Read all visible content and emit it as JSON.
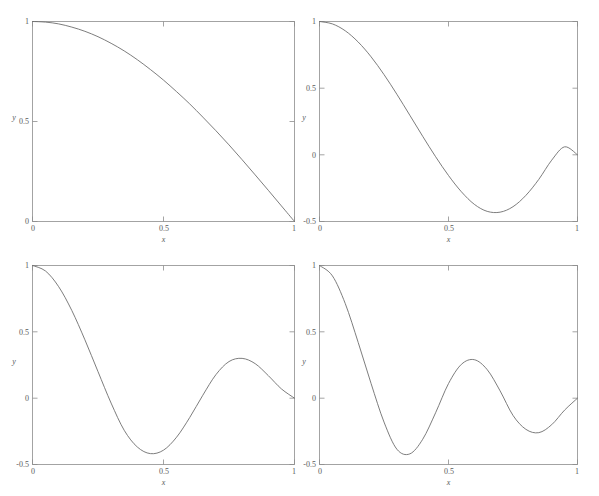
{
  "figure": {
    "background_color": "#ffffff",
    "line_color": "#6e6e6e",
    "axis_color": "#8d8d8d",
    "text_color": "#5a5a5a",
    "panel_count": 4,
    "layout": "2x2"
  },
  "chart_data": [
    {
      "type": "line",
      "panel": "top-left",
      "title": "",
      "xlabel": "x",
      "ylabel": "y",
      "xlim": [
        0,
        1
      ],
      "ylim": [
        0,
        1
      ],
      "xticks": [
        0,
        0.5,
        1
      ],
      "yticks": [
        0,
        0.5,
        1
      ],
      "xticklabels": [
        "0",
        "0.5",
        "1"
      ],
      "yticklabels": [
        "0",
        "0.5",
        "1"
      ],
      "grid": false,
      "legend": "none",
      "series": [
        {
          "name": "mode-1",
          "x": [
            0.0,
            0.05,
            0.1,
            0.15,
            0.2,
            0.25,
            0.3,
            0.35,
            0.4,
            0.45,
            0.5,
            0.55,
            0.6,
            0.65,
            0.7,
            0.75,
            0.8,
            0.85,
            0.9,
            0.95,
            1.0
          ],
          "values": [
            1.0,
            0.997,
            0.988,
            0.972,
            0.951,
            0.924,
            0.891,
            0.853,
            0.809,
            0.76,
            0.707,
            0.649,
            0.588,
            0.522,
            0.454,
            0.383,
            0.309,
            0.233,
            0.156,
            0.078,
            0.0
          ]
        }
      ]
    },
    {
      "type": "line",
      "panel": "top-right",
      "title": "",
      "xlabel": "x",
      "ylabel": "y",
      "xlim": [
        0,
        1
      ],
      "ylim": [
        -0.5,
        1
      ],
      "xticks": [
        0,
        0.5,
        1
      ],
      "yticks": [
        -0.5,
        0,
        0.5,
        1
      ],
      "xticklabels": [
        "0",
        "0.5",
        "1"
      ],
      "yticklabels": [
        "-0.5",
        "0",
        "0.5",
        "1"
      ],
      "grid": false,
      "legend": "none",
      "annotations": [
        {
          "label": "minimum",
          "x": 0.7,
          "y": -0.43
        }
      ],
      "series": [
        {
          "name": "mode-2",
          "x": [
            0.0,
            0.05,
            0.1,
            0.15,
            0.2,
            0.25,
            0.3,
            0.35,
            0.4,
            0.45,
            0.5,
            0.55,
            0.6,
            0.65,
            0.7,
            0.75,
            0.8,
            0.85,
            0.9,
            0.95,
            1.0
          ],
          "values": [
            1.0,
            0.982,
            0.93,
            0.846,
            0.735,
            0.602,
            0.454,
            0.297,
            0.139,
            -0.014,
            -0.155,
            -0.277,
            -0.371,
            -0.424,
            -0.43,
            -0.389,
            -0.304,
            -0.184,
            -0.04,
            0.06,
            0.0
          ]
        }
      ]
    },
    {
      "type": "line",
      "panel": "bottom-left",
      "title": "",
      "xlabel": "x",
      "ylabel": "y",
      "xlim": [
        0,
        1
      ],
      "ylim": [
        -0.5,
        1
      ],
      "xticks": [
        0,
        0.5,
        1
      ],
      "yticks": [
        -0.5,
        0,
        0.5,
        1
      ],
      "xticklabels": [
        "0",
        "0.5",
        "1"
      ],
      "yticklabels": [
        "-0.5",
        "0",
        "0.5",
        "1"
      ],
      "grid": false,
      "legend": "none",
      "annotations": [
        {
          "label": "minimum",
          "x": 0.43,
          "y": -0.42
        },
        {
          "label": "maximum",
          "x": 0.8,
          "y": 0.3
        }
      ],
      "series": [
        {
          "name": "mode-3",
          "x": [
            0.0,
            0.05,
            0.1,
            0.15,
            0.2,
            0.25,
            0.3,
            0.35,
            0.4,
            0.45,
            0.5,
            0.55,
            0.6,
            0.65,
            0.7,
            0.75,
            0.8,
            0.85,
            0.9,
            0.95,
            1.0
          ],
          "values": [
            1.0,
            0.958,
            0.84,
            0.661,
            0.44,
            0.2,
            -0.037,
            -0.242,
            -0.368,
            -0.418,
            -0.392,
            -0.294,
            -0.146,
            0.022,
            0.177,
            0.276,
            0.3,
            0.26,
            0.17,
            0.07,
            0.0
          ]
        }
      ]
    },
    {
      "type": "line",
      "panel": "bottom-right",
      "title": "",
      "xlabel": "x",
      "ylabel": "y",
      "xlim": [
        0,
        1
      ],
      "ylim": [
        -0.5,
        1
      ],
      "xticks": [
        0,
        0.5,
        1
      ],
      "yticks": [
        -0.5,
        0,
        0.5,
        1
      ],
      "xticklabels": [
        "0",
        "0.5",
        "1"
      ],
      "yticklabels": [
        "-0.5",
        "0",
        "0.5",
        "1"
      ],
      "grid": false,
      "legend": "none",
      "annotations": [
        {
          "label": "minimum-1",
          "x": 0.3,
          "y": -0.42
        },
        {
          "label": "maximum-1",
          "x": 0.58,
          "y": 0.29
        },
        {
          "label": "minimum-2",
          "x": 0.85,
          "y": -0.26
        }
      ],
      "series": [
        {
          "name": "mode-4",
          "x": [
            0.0,
            0.05,
            0.1,
            0.15,
            0.2,
            0.25,
            0.3,
            0.35,
            0.4,
            0.45,
            0.5,
            0.55,
            0.6,
            0.65,
            0.7,
            0.75,
            0.8,
            0.85,
            0.9,
            0.95,
            1.0
          ],
          "values": [
            1.0,
            0.922,
            0.712,
            0.42,
            0.11,
            -0.18,
            -0.385,
            -0.42,
            -0.31,
            -0.11,
            0.11,
            0.255,
            0.29,
            0.215,
            0.055,
            -0.13,
            -0.235,
            -0.26,
            -0.2,
            -0.09,
            0.0
          ]
        }
      ]
    }
  ],
  "panels": [
    {
      "id": "panel-top-left",
      "xlabel": "x",
      "ylabel": "y",
      "xticklabels": [
        "0",
        "0.5",
        "1"
      ],
      "yticklabels": [
        "1",
        "0.5",
        "0"
      ]
    },
    {
      "id": "panel-top-right",
      "xlabel": "x",
      "ylabel": "y",
      "xticklabels": [
        "0",
        "0.5",
        "1"
      ],
      "yticklabels": [
        "1",
        "0.5",
        "0",
        "-0.5"
      ]
    },
    {
      "id": "panel-bottom-left",
      "xlabel": "x",
      "ylabel": "y",
      "xticklabels": [
        "0",
        "0.5",
        "1"
      ],
      "yticklabels": [
        "1",
        "0.5",
        "0",
        "-0.5"
      ]
    },
    {
      "id": "panel-bottom-right",
      "xlabel": "x",
      "ylabel": "y",
      "xticklabels": [
        "0",
        "0.5",
        "1"
      ],
      "yticklabels": [
        "1",
        "0.5",
        "0",
        "-0.5"
      ]
    }
  ]
}
